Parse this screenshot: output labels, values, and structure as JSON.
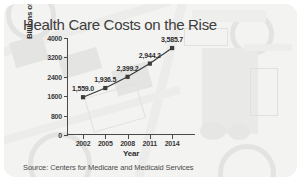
{
  "chart_data": {
    "type": "line",
    "title": "Health Care Costs on the Rise",
    "xlabel": "Year",
    "ylabel": "Billions of Dollars",
    "source": "Source: Centers for Medicare and Medicaid Services",
    "categories": [
      "2002",
      "2005",
      "2008",
      "2011",
      "2014"
    ],
    "values": [
      1559.0,
      1936.5,
      2399.2,
      2944.2,
      3585.7
    ],
    "point_labels": [
      "1,559.0",
      "1,936.5",
      "2,399.2",
      "2,944.2",
      "3,585.7"
    ],
    "ylim": [
      0,
      4000
    ],
    "yticks": [
      0,
      800,
      1600,
      2400,
      3200,
      4000
    ],
    "ytick_labels": [
      "0",
      "800",
      "1600",
      "2400",
      "3200",
      "4000"
    ],
    "xtick_labels": [
      "2002",
      "2005",
      "2008",
      "2011",
      "2014"
    ],
    "grid": false,
    "legend": false,
    "series_color": "#3c3c3c",
    "marker": "square"
  }
}
